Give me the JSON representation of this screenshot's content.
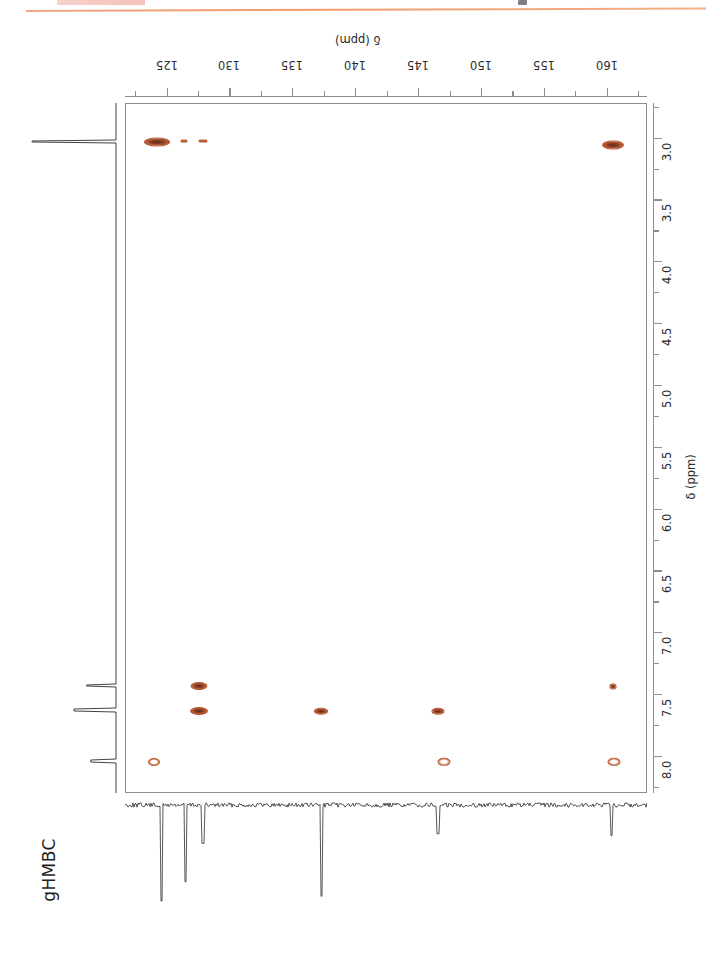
{
  "page": {
    "experiment_label": "gHMBC",
    "header_fragment": "",
    "rule_color": "#ef9a6d",
    "highlight_color": "#f3b6ae"
  },
  "axes": {
    "f2": {
      "title": "δ (ppm)",
      "orientation": "horizontal-top-inverted",
      "nucleus": "13C",
      "min": 121.7,
      "max": 163.2,
      "direction": "increasing-right",
      "tick_labels": [
        "125",
        "130",
        "135",
        "140",
        "145",
        "150",
        "155",
        "160"
      ],
      "tick_values": [
        125,
        130,
        135,
        140,
        145,
        150,
        155,
        160
      ],
      "minor_step": 2.5
    },
    "f1": {
      "title": "δ (ppm)",
      "orientation": "vertical-right",
      "nucleus": "1H",
      "min": 2.72,
      "max": 8.3,
      "direction": "increasing-down",
      "tick_labels": [
        "3.0",
        "3.5",
        "4.0",
        "4.5",
        "5.0",
        "5.5",
        "6.0",
        "6.5",
        "7.0",
        "7.5",
        "8.0"
      ],
      "tick_values": [
        3.0,
        3.5,
        4.0,
        4.5,
        5.0,
        5.5,
        6.0,
        6.5,
        7.0,
        7.5,
        8.0
      ],
      "minor_step": 0.25
    }
  },
  "chart_data": {
    "type": "scatter",
    "title": "gHMBC",
    "xlabel": "δ (ppm)",
    "ylabel": "δ (ppm)",
    "xlim": [
      121.7,
      163.2
    ],
    "ylim": [
      2.72,
      8.3
    ],
    "grid": false,
    "legend": "none",
    "contour_color": "#8c4024",
    "series": [
      {
        "name": "cross-peaks",
        "points": [
          {
            "x": 124.2,
            "y": 3.03,
            "rx": 13,
            "ry": 4.5,
            "style": "filled"
          },
          {
            "x": 126.3,
            "y": 3.02,
            "rx": 3.5,
            "ry": 1.4,
            "style": "faint"
          },
          {
            "x": 127.8,
            "y": 3.02,
            "rx": 4.5,
            "ry": 1.4,
            "style": "faint"
          },
          {
            "x": 160.4,
            "y": 3.05,
            "rx": 11,
            "ry": 4.5,
            "style": "filled"
          },
          {
            "x": 127.5,
            "y": 7.43,
            "rx": 8.5,
            "ry": 4.0,
            "style": "filled"
          },
          {
            "x": 127.5,
            "y": 7.63,
            "rx": 9.0,
            "ry": 4.0,
            "style": "filled"
          },
          {
            "x": 137.2,
            "y": 7.63,
            "rx": 7.0,
            "ry": 3.2,
            "style": "filled"
          },
          {
            "x": 146.5,
            "y": 7.63,
            "rx": 6.5,
            "ry": 3.2,
            "style": "filled"
          },
          {
            "x": 160.4,
            "y": 7.43,
            "rx": 3.5,
            "ry": 2.6,
            "style": "filled"
          },
          {
            "x": 123.9,
            "y": 8.04,
            "rx": 6.0,
            "ry": 4.0,
            "style": "hollow"
          },
          {
            "x": 147.0,
            "y": 8.04,
            "rx": 6.5,
            "ry": 4.2,
            "style": "hollow"
          },
          {
            "x": 160.5,
            "y": 8.04,
            "rx": 6.5,
            "ry": 4.2,
            "style": "hollow"
          }
        ]
      }
    ],
    "f2_projection": {
      "description": "1D 13C trace below the contour map, negative-going peaks",
      "peaks_ppm": [
        124.6,
        126.5,
        127.9,
        137.3,
        146.6,
        160.4
      ],
      "peak_depths": [
        1.0,
        0.8,
        0.4,
        0.95,
        0.3,
        0.32
      ]
    },
    "f1_projection": {
      "description": "1D 1H trace left of the contour map, peaks pointing left",
      "peaks_ppm": [
        3.03,
        7.43,
        7.63,
        8.04
      ],
      "peak_heights": [
        1.0,
        0.35,
        0.5,
        0.3
      ]
    }
  }
}
